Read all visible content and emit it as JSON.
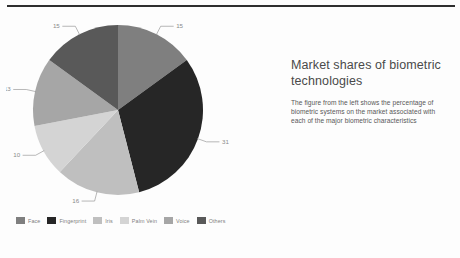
{
  "slide": {
    "background_color": "#fdfdfd",
    "rule_color": "#2e2e2e"
  },
  "panel": {
    "title": "Market shares of biometric technologies",
    "body": "The figure from the left shows the percentage of biometric systems on the market associated with each of the major biometric characteristics"
  },
  "legend": {
    "items": [
      {
        "label": "Face",
        "color": "#7f7f7f"
      },
      {
        "label": "Fingerprint",
        "color": "#262626"
      },
      {
        "label": "Iris",
        "color": "#bfbfbf"
      },
      {
        "label": "Palm Vein",
        "color": "#d4d4d4"
      },
      {
        "label": "Voice",
        "color": "#a6a6a6"
      },
      {
        "label": "Others",
        "color": "#595959"
      }
    ]
  },
  "chart_data": {
    "type": "pie",
    "title": "Market shares of biometric technologies",
    "categories": [
      "Face",
      "Fingerprint",
      "Iris",
      "Palm Vein",
      "Voice",
      "Others"
    ],
    "values": [
      15,
      31,
      16,
      10,
      13,
      15
    ],
    "value_labels": [
      "15",
      "31",
      "16",
      "10",
      "13",
      "15"
    ],
    "colors": [
      "#7f7f7f",
      "#262626",
      "#bfbfbf",
      "#d4d4d4",
      "#a6a6a6",
      "#595959"
    ],
    "unit": "percent",
    "total": 100,
    "start_angle_deg": 0,
    "direction": "clockwise",
    "legend_position": "bottom-left",
    "grid": false,
    "xlabel": "",
    "ylabel": ""
  }
}
